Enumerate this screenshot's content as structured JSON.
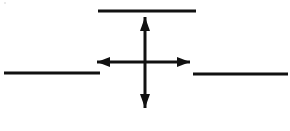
{
  "figure": {
    "canvas": {
      "width": 290,
      "height": 131,
      "background": "#ffffff"
    },
    "stroke_color": "#111111",
    "elements": {
      "top_line": {
        "name": "Upper horizontal line segment",
        "x1": 98,
        "y1": 11,
        "x2": 196,
        "y2": 11,
        "thickness": 3
      },
      "left_line": {
        "name": "Left horizontal line segment",
        "x1": 4,
        "y1": 73,
        "x2": 100,
        "y2": 73,
        "thickness": 3
      },
      "right_line": {
        "name": "Right horizontal line segment",
        "x1": 193,
        "y1": 74,
        "x2": 288,
        "y2": 74,
        "thickness": 3
      },
      "vertical_arrow": {
        "name": "Vertical double-headed arrow",
        "x": 145,
        "y_top": 17,
        "y_bottom": 108,
        "thickness": 3,
        "head_half_width": 5,
        "head_length": 14
      },
      "horizontal_arrow": {
        "name": "Horizontal double-headed arrow",
        "y": 62,
        "x_left": 97,
        "x_right": 190,
        "thickness": 3,
        "head_half_width": 5,
        "head_length": 13
      }
    }
  }
}
